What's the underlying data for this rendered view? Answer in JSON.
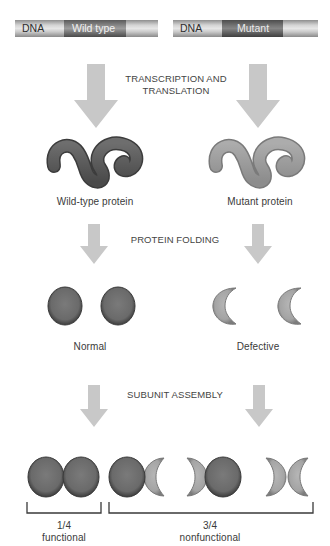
{
  "dna": {
    "wild": {
      "prefix": "DNA",
      "gene": "Wild type"
    },
    "mutant": {
      "prefix": "DNA",
      "gene": "Mutant"
    }
  },
  "steps": {
    "step1_line1": "TRANSCRIPTION AND",
    "step1_line2": "TRANSLATION",
    "step2": "PROTEIN FOLDING",
    "step3": "SUBUNIT ASSEMBLY"
  },
  "proteins": {
    "wild_label": "Wild-type protein",
    "mutant_label": "Mutant protein"
  },
  "folded": {
    "normal_label": "Normal",
    "defective_label": "Defective"
  },
  "outcome": {
    "functional_fraction": "1/4",
    "functional_label": "functional",
    "nonfunctional_fraction": "3/4",
    "nonfunctional_label": "nonfunctional"
  },
  "colors": {
    "arrow": "#c8c8c8",
    "wild_protein": "#5e5e5e",
    "mutant_protein": "#9a9a9a",
    "normal_subunit": "#6a6a6a",
    "defective_subunit": "#a6a6a6",
    "bracket": "#3a3a3a"
  }
}
